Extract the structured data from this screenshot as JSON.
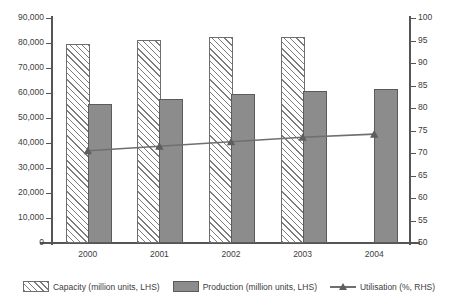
{
  "chart_data": {
    "type": "bar",
    "title": "",
    "subtitle": "",
    "xlabel": "",
    "ylabel": "",
    "categories": [
      "2000",
      "2001",
      "2002",
      "2003",
      "2004"
    ],
    "series": [
      {
        "name": "Capacity (million units, LHS)",
        "axis": "left",
        "type": "bar",
        "style": "hatched",
        "values": [
          79000,
          80500,
          81500,
          81800,
          null
        ]
      },
      {
        "name": "Production (million units, LHS)",
        "axis": "left",
        "type": "bar",
        "style": "solid-gray",
        "values": [
          55000,
          57000,
          59000,
          60000,
          61000
        ]
      },
      {
        "name": "Utilisation (%, RHS)",
        "axis": "right",
        "type": "line",
        "marker": "triangle",
        "values": [
          70.5,
          71.5,
          72.5,
          73.5,
          74.2
        ]
      }
    ],
    "left_axis": {
      "min": 0,
      "max": 90000,
      "step": 10000,
      "tick_labels": [
        "0",
        "10,000",
        "20,000",
        "30,000",
        "40,000",
        "50,000",
        "60,000",
        "70,000",
        "80,000",
        "90,000"
      ]
    },
    "right_axis": {
      "min": 50,
      "max": 100,
      "step": 5,
      "tick_labels": [
        "50",
        "55",
        "60",
        "65",
        "70",
        "75",
        "80",
        "85",
        "90",
        "95",
        "100"
      ]
    },
    "grid": false,
    "legend_position": "bottom",
    "colors": {
      "capacity_hatch": "#7d7d7d",
      "production_fill": "#8c8c8c",
      "utilisation_line": "#6f6f6f",
      "axis": "#555555",
      "text": "#3d3d3d"
    }
  },
  "legend": {
    "items": [
      {
        "label": "Capacity (million units, LHS)",
        "icon": "hatched-bar-swatch"
      },
      {
        "label": "Production (million units, LHS)",
        "icon": "solid-bar-swatch"
      },
      {
        "label": "Utilisation (%, RHS)",
        "icon": "line-triangle-marker-swatch"
      }
    ]
  }
}
